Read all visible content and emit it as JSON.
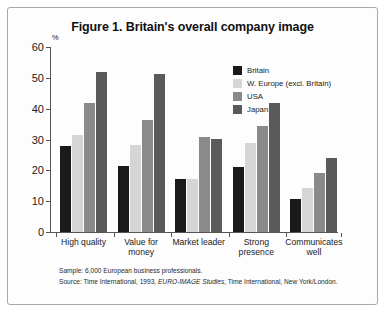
{
  "figure": {
    "title": "Figure 1. Britain's overall company image",
    "y_unit": "%"
  },
  "notes": {
    "sample_line": "Sample: 6,000 European business professionals.",
    "source_prefix": "Source: Time International, 1993, ",
    "source_italic": "EURO-IMAGE Studies",
    "source_suffix": ", Time International, New York/London."
  },
  "colors": {
    "britain": "#1a1a1a",
    "w_europe": "#d5d5d5",
    "usa": "#8a8a8a",
    "japan": "#5a5a5a",
    "axis": "#555555",
    "frame": "#a8a8a8",
    "background": "#fdfdfd"
  },
  "chart_data": {
    "type": "bar",
    "title": "Figure 1. Britain's overall company image",
    "xlabel": "",
    "ylabel": "%",
    "ylim": [
      0,
      60
    ],
    "yticks": [
      0,
      10,
      20,
      30,
      40,
      50,
      60
    ],
    "grid": false,
    "legend_position": "top-right",
    "categories": [
      "High quality",
      "Value for\nmoney",
      "Market leader",
      "Strong\npresence",
      "Communicates\nwell"
    ],
    "series": [
      {
        "name": "Britain",
        "color": "#1a1a1a",
        "values": [
          28,
          21.5,
          17.3,
          21,
          10.8
        ]
      },
      {
        "name": "W. Europe (excl. Britain)",
        "color": "#d5d5d5",
        "values": [
          31.5,
          28.3,
          17.3,
          28.8,
          14.2
        ]
      },
      {
        "name": "USA",
        "color": "#8a8a8a",
        "values": [
          42,
          36.2,
          30.7,
          34.3,
          19.3
        ]
      },
      {
        "name": "Japan",
        "color": "#5a5a5a",
        "values": [
          52,
          51.4,
          30.3,
          42,
          24
        ]
      }
    ]
  }
}
